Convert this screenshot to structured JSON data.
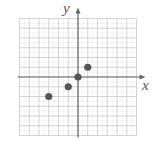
{
  "chart_data": {
    "type": "scatter",
    "title": "",
    "xlabel": "x",
    "ylabel": "y",
    "xlim": [
      -6,
      6
    ],
    "ylim": [
      -6,
      6
    ],
    "grid": true,
    "legend": null,
    "series": [
      {
        "name": "points",
        "points": [
          {
            "x": -3,
            "y": -2
          },
          {
            "x": -1,
            "y": -1
          },
          {
            "x": 0,
            "y": 0
          },
          {
            "x": 1,
            "y": 1
          }
        ]
      }
    ]
  },
  "colors": {
    "grid": "#c8c8c8",
    "axis": "#666666",
    "point": "#555555"
  },
  "labels": {
    "x": "x",
    "y": "y"
  }
}
